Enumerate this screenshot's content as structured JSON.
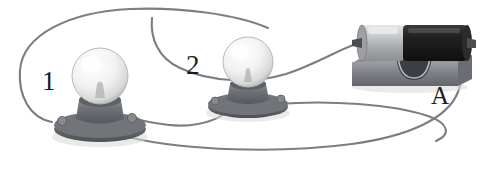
{
  "figure": {
    "background_color": "#ffffff",
    "width": 484,
    "height": 171
  },
  "labels": {
    "bulb_1": "1",
    "bulb_2": "2",
    "battery": "A"
  },
  "components": [
    {
      "id": "lamp-1",
      "name": "light-bulb-1",
      "label": "1",
      "type": "incandescent-lamp-in-socket",
      "bulb_color": "#e9e9e9",
      "socket_color": "#6e7175",
      "center_x": 100,
      "center_y": 82
    },
    {
      "id": "lamp-2",
      "name": "light-bulb-2",
      "label": "2",
      "type": "incandescent-lamp-in-socket",
      "bulb_color": "#e9e9e9",
      "socket_color": "#6e7175",
      "center_x": 248,
      "center_y": 66
    },
    {
      "id": "battery-a",
      "name": "battery-in-holder",
      "label": "A",
      "type": "dry-cell-battery",
      "cell_light_color": "#c3c5c7",
      "cell_dark_color": "#1f1f1f",
      "holder_color": "#7d8084",
      "center_x": 410,
      "center_y": 52
    }
  ],
  "wires": {
    "color": "#7b7e82",
    "count": 4,
    "segments": [
      "lamp-1 socket left terminal up and over the top to lamp-2 socket right terminal",
      "lamp-2 socket area over the top right to battery left terminal",
      "lamp-1 socket right terminal to lamp-2 socket left terminal along the bottom",
      "battery right terminal down around the bottom back to lamp-1 socket left terminal"
    ]
  },
  "colors": {
    "wire": "#7b7e82",
    "bulb_glass": "#e9e9e9",
    "socket_metal": "#6e7175",
    "battery_dark": "#1f1f1f",
    "battery_light": "#c3c5c7",
    "holder": "#7d8084",
    "label_text": "#1c1c1c",
    "background": "#ffffff"
  }
}
